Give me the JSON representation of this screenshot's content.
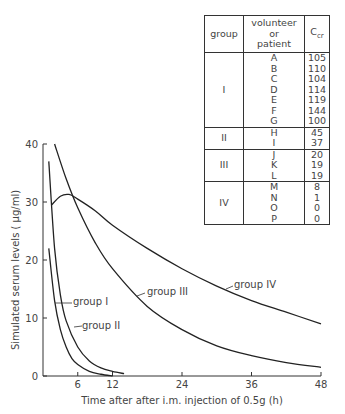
{
  "chart_data": {
    "type": "line",
    "title": "",
    "xlabel": "Time after after i.m. injection of 0.5g (h)",
    "ylabel": "Simulated serum levels ( μg/ml)",
    "xlim": [
      0,
      48
    ],
    "ylim": [
      0,
      40
    ],
    "x_ticks": [
      "6",
      "12",
      "24",
      "36",
      "48"
    ],
    "y_ticks": [
      "0",
      "10",
      "20",
      "30",
      "40"
    ],
    "grid": false,
    "series": [
      {
        "name": "group I",
        "x": [
          1,
          2,
          3,
          4,
          5,
          6,
          8,
          10,
          12
        ],
        "values": [
          22,
          13,
          8,
          5,
          3,
          2,
          0.8,
          0.3,
          0
        ]
      },
      {
        "name": "group II",
        "x": [
          1,
          2,
          3,
          4,
          6,
          8,
          10,
          12,
          14
        ],
        "values": [
          37,
          22,
          14,
          9.5,
          5,
          2.6,
          1.4,
          0.8,
          0.4
        ]
      },
      {
        "name": "group III",
        "x": [
          2,
          4,
          6,
          9,
          12,
          18,
          24,
          30,
          36,
          42,
          48
        ],
        "values": [
          40,
          34,
          29,
          23,
          18.5,
          12,
          8,
          5.2,
          3.5,
          2.3,
          1.5
        ]
      },
      {
        "name": "group IV",
        "x": [
          1.5,
          3,
          4.5,
          6,
          9,
          12,
          18,
          24,
          30,
          36,
          42,
          48
        ],
        "values": [
          29.5,
          31,
          31.3,
          30.5,
          28.5,
          26,
          22,
          18.5,
          15.5,
          13,
          11,
          9
        ]
      }
    ],
    "annotations": [
      "group I",
      "group II",
      "group III",
      "group IV"
    ]
  },
  "table": {
    "headers": {
      "group": "group",
      "volunteer": [
        "volunteer",
        "or",
        "patient"
      ],
      "ccr": "C",
      "ccr_sub": "cr"
    },
    "rows": [
      {
        "group": "I",
        "ids": [
          "A",
          "B",
          "C",
          "D",
          "E",
          "F",
          "G"
        ],
        "ccr": [
          "105",
          "110",
          "104",
          "114",
          "119",
          "144",
          "100"
        ]
      },
      {
        "group": "II",
        "ids": [
          "H",
          "I"
        ],
        "ccr": [
          "45",
          "37"
        ]
      },
      {
        "group": "III",
        "ids": [
          "J",
          "K",
          "L"
        ],
        "ccr": [
          "20",
          "19",
          "19"
        ]
      },
      {
        "group": "IV",
        "ids": [
          "M",
          "N",
          "O",
          "P"
        ],
        "ccr": [
          "8",
          "1",
          "0",
          "0"
        ]
      }
    ]
  }
}
